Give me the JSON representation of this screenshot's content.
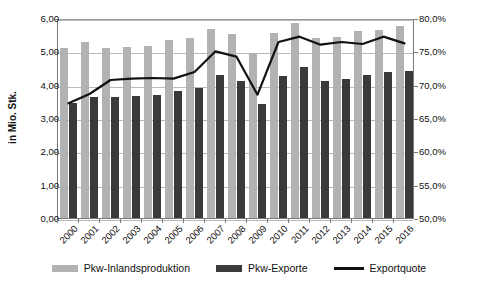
{
  "chart_data": {
    "type": "bar",
    "title": "",
    "subtitle": "",
    "xlabel": "",
    "ylabel": "in Mio. Stk.",
    "ylabel_secondary": "",
    "categories": [
      "2000",
      "2001",
      "2002",
      "2003",
      "2004",
      "2005",
      "2006",
      "2007",
      "2008",
      "2009",
      "2010",
      "2011",
      "2012",
      "2013",
      "2014",
      "2015",
      "2016"
    ],
    "ylim": [
      0,
      6
    ],
    "ylim_secondary": [
      50,
      80
    ],
    "yticks": [
      "0,00",
      "1,00",
      "2,00",
      "3,00",
      "4,00",
      "5,00",
      "6,00"
    ],
    "yticks_secondary": [
      "50,0%",
      "55,0%",
      "60,0%",
      "65,0%",
      "70,0%",
      "75,0%",
      "80,0%"
    ],
    "grid": true,
    "legend_position": "bottom",
    "series": [
      {
        "name": "Pkw-Inlandsproduktion",
        "type": "bar",
        "axis": "left",
        "color": "#b2b2b2",
        "values": [
          5.11,
          5.27,
          5.1,
          5.13,
          5.16,
          5.34,
          5.4,
          5.68,
          5.53,
          4.96,
          5.55,
          5.86,
          5.39,
          5.44,
          5.6,
          5.65,
          5.75
        ]
      },
      {
        "name": "Pkw-Exporte",
        "type": "bar",
        "axis": "left",
        "color": "#3a3a3a",
        "values": [
          3.45,
          3.63,
          3.62,
          3.65,
          3.68,
          3.8,
          3.9,
          4.28,
          4.12,
          3.41,
          4.26,
          4.54,
          4.11,
          4.17,
          4.28,
          4.38,
          4.4
        ]
      },
      {
        "name": "Exportquote",
        "type": "line",
        "axis": "right",
        "color": "#111111",
        "values": [
          67.5,
          68.9,
          71.0,
          71.2,
          71.3,
          71.2,
          72.2,
          75.3,
          74.5,
          68.8,
          76.7,
          77.5,
          76.3,
          76.7,
          76.4,
          77.5,
          76.5
        ]
      }
    ]
  },
  "legend": {
    "items": [
      {
        "label": "Pkw-Inlandsproduktion"
      },
      {
        "label": "Pkw-Exporte"
      },
      {
        "label": "Exportquote"
      }
    ]
  }
}
